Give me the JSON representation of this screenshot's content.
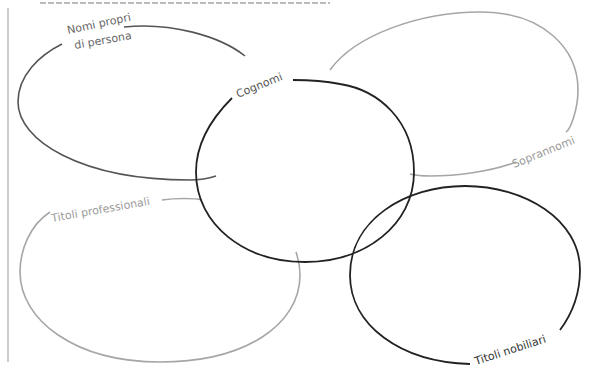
{
  "diagram": {
    "type": "overlapping-ellipses",
    "header_text": "",
    "colors": {
      "dark": "#444444",
      "darker": "#222222",
      "light": "#a6a6a6",
      "label_dark": "#555555",
      "label_light": "#9a9a9a"
    },
    "ellipses": [
      {
        "id": "nomi-propri",
        "label_line1": "Nomi propri",
        "label_line2": "di persona",
        "color": "#555555"
      },
      {
        "id": "cognomi",
        "label": "Cognomi",
        "color": "#222222"
      },
      {
        "id": "soprannomi",
        "label": "Soprannomi",
        "color": "#a6a6a6"
      },
      {
        "id": "titoli-professionali",
        "label": "Titoli professionali",
        "color": "#a6a6a6"
      },
      {
        "id": "titoli-nobiliari",
        "label": "Titoli nobiliari",
        "color": "#222222"
      }
    ]
  }
}
